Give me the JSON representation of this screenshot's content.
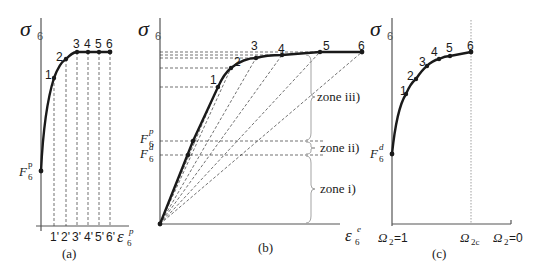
{
  "panels": {
    "a": {
      "caption": "(a)",
      "y_label": "σ",
      "y_label_sub": "6",
      "x_label": "ε",
      "x_label_sub": "6",
      "x_label_sup": "p",
      "f_label": "F",
      "f_label_sub": "6",
      "f_label_sup": "p",
      "point_labels": [
        "1",
        "2",
        "3",
        "4",
        "5",
        "6"
      ],
      "tick_labels": [
        "1'",
        "2'",
        "3'",
        "4'",
        "5'",
        "6'"
      ]
    },
    "b": {
      "caption": "(b)",
      "y_label": "σ",
      "y_label_sub": "6",
      "x_label": "ε",
      "x_label_sub": "6",
      "x_label_sup": "e",
      "fp_label": "F",
      "fp_label_sub": "6",
      "fp_label_sup": "p",
      "fd_label": "F",
      "fd_label_sub": "6",
      "fd_label_sup": "d",
      "point_labels": [
        "1",
        "2",
        "3",
        "4",
        "5",
        "6"
      ],
      "zones": [
        "zone iii)",
        "zone ii)",
        "zone i)"
      ]
    },
    "c": {
      "caption": "(c)",
      "y_label": "σ",
      "y_label_sub": "6",
      "fd_label": "F",
      "fd_label_sub": "6",
      "fd_label_sup": "d",
      "point_labels": [
        "1",
        "2",
        "3",
        "4",
        "5",
        "6"
      ],
      "x_ticks": {
        "left": "Ω",
        "left_sub": "2",
        "left_val": "=1",
        "mid": "Ω",
        "mid_sub": "2c",
        "right": "Ω",
        "right_sub": "2",
        "right_val": "=0"
      }
    }
  },
  "colors": {
    "ink": "#1a1a1a",
    "axis": "#555555",
    "dash": "#333333"
  }
}
